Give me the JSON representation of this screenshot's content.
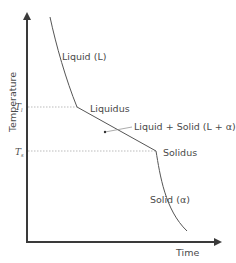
{
  "diagram": {
    "axes": {
      "y_label": "Temperature",
      "x_label": "Time"
    },
    "temperature_marks": [
      {
        "symbol": "T",
        "subscript": "l",
        "meaning": "liquidus temperature"
      },
      {
        "symbol": "T",
        "subscript": "s",
        "meaning": "solidus temperature"
      }
    ],
    "regions": {
      "liquid": "Liquid (L)",
      "liquidus": "Liquidus",
      "mushy": "Liquid + Solid (L + α)",
      "solidus": "Solidus",
      "solid": "Solid (α)"
    },
    "colors": {
      "axis": "#3a3a3a",
      "curve": "#555555",
      "guide": "#aaaaaa",
      "text": "#4a4a4a"
    }
  }
}
